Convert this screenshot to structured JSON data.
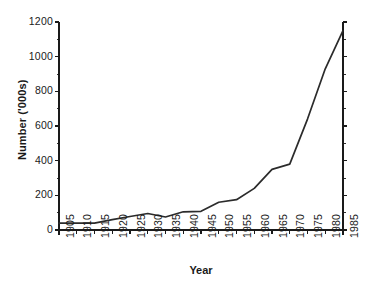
{
  "chart_data": {
    "type": "line",
    "title": "",
    "subtitle": "",
    "xlabel": "Year",
    "ylabel": "Number ('000s)",
    "xlim": [
      1905,
      1985
    ],
    "ylim": [
      0,
      1200
    ],
    "grid": false,
    "legend": false,
    "legend_position": "none",
    "x_tick_labels": [
      "1905",
      "1910",
      "1915",
      "1920",
      "1925",
      "1930",
      "1935",
      "1940",
      "1945",
      "1950",
      "1955",
      "1960",
      "1965",
      "1970",
      "1975",
      "1980",
      "1985"
    ],
    "y_tick_labels": [
      "0",
      "200",
      "400",
      "600",
      "800",
      "1000",
      "1200"
    ],
    "y_ticks": [
      0,
      200,
      400,
      600,
      800,
      1000,
      1200
    ],
    "x_ticks": [
      1905,
      1910,
      1915,
      1920,
      1925,
      1930,
      1935,
      1940,
      1945,
      1950,
      1955,
      1960,
      1965,
      1970,
      1975,
      1980,
      1985
    ],
    "x": [
      1905,
      1910,
      1915,
      1920,
      1925,
      1930,
      1935,
      1940,
      1945,
      1950,
      1955,
      1960,
      1965,
      1970,
      1975,
      1980,
      1985
    ],
    "values": [
      40,
      40,
      40,
      60,
      78,
      95,
      75,
      105,
      108,
      160,
      175,
      240,
      350,
      380,
      640,
      930,
      1150
    ],
    "series": [
      {
        "name": "Number ('000s)",
        "color": "#2b2b2b",
        "values": [
          40,
          40,
          40,
          60,
          78,
          95,
          75,
          105,
          108,
          160,
          175,
          240,
          350,
          380,
          640,
          930,
          1150
        ]
      }
    ],
    "line_color": "#2b2b2b",
    "axis_color": "#1a1a1a",
    "background_color": "#ffffff"
  }
}
